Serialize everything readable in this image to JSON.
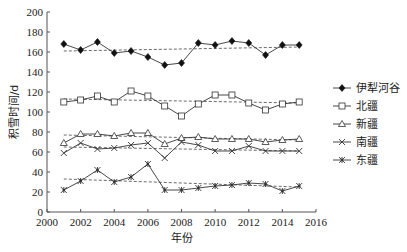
{
  "chart_data": {
    "type": "line",
    "title": "",
    "xlabel": "年份",
    "ylabel": "积雪时间/d",
    "xlim": [
      2000,
      2016
    ],
    "ylim": [
      0,
      200
    ],
    "xticks": [
      2000,
      2002,
      2004,
      2006,
      2008,
      2010,
      2012,
      2014,
      2016
    ],
    "yticks": [
      0,
      20,
      40,
      60,
      80,
      100,
      120,
      140,
      160,
      180,
      200
    ],
    "grid": false,
    "legend_position": "right",
    "x": [
      2001,
      2002,
      2003,
      2004,
      2005,
      2006,
      2007,
      2008,
      2009,
      2010,
      2011,
      2012,
      2013,
      2014,
      2015
    ],
    "series": [
      {
        "name": "伊犁河谷",
        "marker": "filled-diamond",
        "trend": [
          161,
          165
        ],
        "values": [
          168,
          162,
          170,
          159,
          161,
          155,
          147,
          149,
          169,
          167,
          171,
          169,
          157,
          167,
          167
        ]
      },
      {
        "name": "北疆",
        "marker": "open-square",
        "trend": [
          113,
          109
        ],
        "values": [
          110,
          112,
          116,
          110,
          121,
          116,
          106,
          96,
          108,
          117,
          117,
          109,
          102,
          108,
          110
        ]
      },
      {
        "name": "新疆",
        "marker": "open-triangle",
        "trend": [
          77,
          72
        ],
        "values": [
          69,
          78,
          78,
          76,
          79,
          79,
          68,
          74,
          75,
          73,
          73,
          73,
          70,
          72,
          73
        ]
      },
      {
        "name": "南疆",
        "marker": "x-cross",
        "trend": [
          65,
          61
        ],
        "values": [
          59,
          69,
          63,
          64,
          67,
          69,
          54,
          70,
          67,
          61,
          61,
          66,
          61,
          61,
          61
        ]
      },
      {
        "name": "东疆",
        "marker": "asterisk",
        "trend": [
          33,
          25
        ],
        "values": [
          22,
          31,
          42,
          30,
          35,
          48,
          22,
          22,
          24,
          26,
          27,
          29,
          28,
          21,
          26
        ]
      }
    ],
    "annotations": [
      "dashed linear trend lines for each series"
    ]
  },
  "labels": {
    "xlabel": "年份",
    "ylabel": "积雪时间/d"
  }
}
